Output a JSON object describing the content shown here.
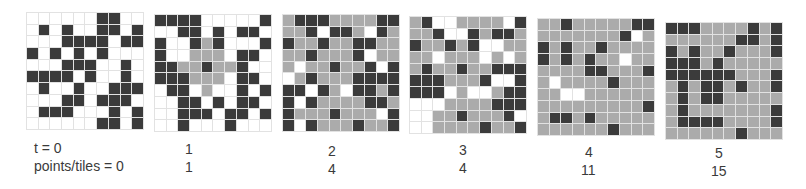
{
  "figure": {
    "legend": {
      "0": "empty",
      "1": "tile",
      "2": "point"
    },
    "colors": {
      "empty": "#ffffff",
      "tile": "#ababab",
      "point": "#3b3b3b",
      "gridline": "#e2e2e2"
    },
    "row_labels": {
      "t": "t = 0",
      "points": "points/tiles = 0"
    },
    "panels": [
      {
        "t": "t = 0",
        "points_tiles": "points/tiles = 0",
        "cells": [
          [
            0,
            0,
            0,
            0,
            0,
            0,
            2,
            2,
            0,
            0
          ],
          [
            0,
            2,
            0,
            2,
            0,
            0,
            2,
            2,
            0,
            2
          ],
          [
            0,
            0,
            0,
            2,
            2,
            2,
            2,
            0,
            2,
            2
          ],
          [
            2,
            0,
            2,
            0,
            2,
            0,
            2,
            0,
            0,
            0
          ],
          [
            0,
            0,
            0,
            2,
            2,
            2,
            0,
            0,
            2,
            0
          ],
          [
            2,
            2,
            2,
            2,
            0,
            2,
            0,
            0,
            2,
            0
          ],
          [
            0,
            2,
            0,
            0,
            2,
            0,
            0,
            2,
            2,
            2
          ],
          [
            0,
            0,
            0,
            2,
            2,
            0,
            2,
            2,
            2,
            0
          ],
          [
            0,
            2,
            2,
            2,
            0,
            0,
            0,
            2,
            0,
            2
          ],
          [
            0,
            0,
            0,
            0,
            0,
            0,
            2,
            2,
            0,
            2
          ]
        ]
      },
      {
        "t": "1",
        "points_tiles": "1",
        "cells": [
          [
            2,
            2,
            2,
            2,
            0,
            0,
            0,
            0,
            0,
            2
          ],
          [
            0,
            0,
            2,
            2,
            0,
            2,
            0,
            2,
            2,
            0
          ],
          [
            2,
            0,
            0,
            2,
            1,
            2,
            0,
            0,
            0,
            2
          ],
          [
            2,
            0,
            0,
            1,
            1,
            1,
            0,
            2,
            2,
            0
          ],
          [
            2,
            2,
            1,
            1,
            2,
            1,
            1,
            2,
            0,
            0
          ],
          [
            2,
            2,
            2,
            1,
            1,
            1,
            0,
            2,
            2,
            0
          ],
          [
            0,
            2,
            2,
            0,
            1,
            0,
            0,
            2,
            0,
            2
          ],
          [
            0,
            0,
            2,
            2,
            0,
            2,
            0,
            2,
            2,
            0
          ],
          [
            0,
            0,
            2,
            2,
            2,
            0,
            2,
            2,
            0,
            2
          ],
          [
            0,
            0,
            2,
            0,
            0,
            0,
            2,
            0,
            0,
            0
          ]
        ]
      },
      {
        "t": "2",
        "points_tiles": "4",
        "cells": [
          [
            1,
            2,
            2,
            2,
            1,
            1,
            1,
            1,
            2,
            2
          ],
          [
            1,
            1,
            2,
            0,
            2,
            2,
            1,
            0,
            2,
            1
          ],
          [
            2,
            1,
            1,
            2,
            1,
            1,
            2,
            2,
            1,
            1
          ],
          [
            1,
            1,
            2,
            1,
            1,
            1,
            2,
            0,
            1,
            1
          ],
          [
            1,
            0,
            1,
            1,
            2,
            1,
            1,
            2,
            0,
            2
          ],
          [
            0,
            1,
            2,
            1,
            1,
            1,
            2,
            2,
            2,
            2
          ],
          [
            2,
            2,
            0,
            2,
            1,
            0,
            2,
            2,
            1,
            2
          ],
          [
            2,
            0,
            2,
            1,
            1,
            1,
            1,
            2,
            2,
            1
          ],
          [
            2,
            1,
            1,
            1,
            2,
            1,
            1,
            1,
            0,
            2
          ],
          [
            2,
            0,
            2,
            1,
            1,
            1,
            2,
            1,
            1,
            2
          ]
        ]
      },
      {
        "t": "3",
        "points_tiles": "4",
        "cells": [
          [
            1,
            2,
            0,
            0,
            1,
            1,
            1,
            1,
            0,
            2
          ],
          [
            1,
            1,
            2,
            0,
            0,
            2,
            1,
            2,
            2,
            1
          ],
          [
            2,
            1,
            1,
            2,
            1,
            2,
            0,
            0,
            1,
            1
          ],
          [
            1,
            1,
            0,
            1,
            1,
            1,
            0,
            1,
            0,
            1
          ],
          [
            1,
            2,
            1,
            1,
            2,
            1,
            1,
            2,
            2,
            2
          ],
          [
            2,
            2,
            2,
            1,
            1,
            1,
            2,
            0,
            0,
            2
          ],
          [
            2,
            2,
            2,
            0,
            1,
            0,
            0,
            1,
            2,
            2
          ],
          [
            0,
            0,
            0,
            1,
            1,
            1,
            1,
            2,
            2,
            2
          ],
          [
            0,
            0,
            1,
            1,
            2,
            1,
            1,
            1,
            2,
            0
          ],
          [
            0,
            0,
            1,
            1,
            1,
            1,
            2,
            1,
            1,
            2
          ]
        ]
      },
      {
        "t": "4",
        "points_tiles": "11",
        "cells": [
          [
            1,
            1,
            2,
            1,
            1,
            1,
            1,
            1,
            2,
            2
          ],
          [
            1,
            1,
            1,
            1,
            1,
            1,
            1,
            2,
            0,
            1
          ],
          [
            2,
            1,
            2,
            1,
            1,
            2,
            1,
            1,
            1,
            1
          ],
          [
            2,
            1,
            2,
            1,
            2,
            1,
            1,
            0,
            1,
            1
          ],
          [
            1,
            1,
            1,
            1,
            2,
            2,
            1,
            1,
            1,
            2
          ],
          [
            1,
            0,
            1,
            1,
            1,
            1,
            2,
            1,
            1,
            1
          ],
          [
            1,
            1,
            0,
            0,
            1,
            1,
            1,
            1,
            1,
            1
          ],
          [
            1,
            1,
            1,
            1,
            1,
            1,
            1,
            1,
            1,
            2
          ],
          [
            1,
            2,
            2,
            1,
            2,
            1,
            1,
            1,
            1,
            1
          ],
          [
            1,
            1,
            1,
            1,
            1,
            1,
            2,
            1,
            1,
            1
          ]
        ]
      },
      {
        "t": "5",
        "points_tiles": "15",
        "cells": [
          [
            2,
            2,
            2,
            1,
            1,
            1,
            1,
            2,
            1,
            2
          ],
          [
            1,
            1,
            1,
            1,
            1,
            1,
            2,
            2,
            1,
            2
          ],
          [
            2,
            1,
            2,
            1,
            1,
            2,
            1,
            1,
            1,
            2
          ],
          [
            2,
            2,
            2,
            1,
            2,
            1,
            1,
            1,
            1,
            1
          ],
          [
            2,
            2,
            2,
            2,
            2,
            2,
            1,
            1,
            1,
            2
          ],
          [
            1,
            2,
            1,
            2,
            2,
            1,
            2,
            1,
            1,
            2
          ],
          [
            1,
            2,
            1,
            2,
            2,
            1,
            1,
            1,
            1,
            1
          ],
          [
            1,
            2,
            1,
            1,
            1,
            1,
            1,
            1,
            1,
            2
          ],
          [
            1,
            2,
            2,
            2,
            2,
            1,
            1,
            1,
            1,
            2
          ],
          [
            1,
            1,
            1,
            1,
            1,
            1,
            2,
            1,
            1,
            1
          ]
        ]
      }
    ]
  }
}
